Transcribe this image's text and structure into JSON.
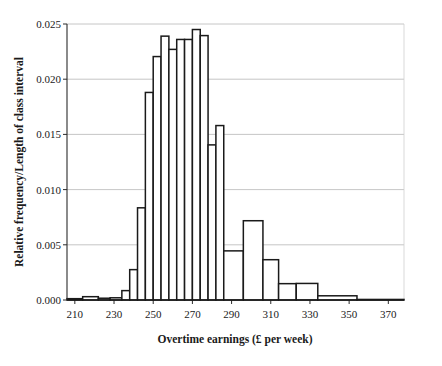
{
  "chart_data": {
    "type": "bar",
    "subtype": "histogram",
    "title": "",
    "xlabel": "Overtime earnings (£ per week)",
    "ylabel": "Relative frequency/Length of class interval",
    "xlim": [
      206,
      378
    ],
    "ylim": [
      0.0,
      0.025
    ],
    "grid": true,
    "legend": false,
    "y_ticks": [
      0.0,
      0.005,
      0.01,
      0.015,
      0.02,
      0.025
    ],
    "y_tick_labels": [
      "0.000",
      "0.005",
      "0.010",
      "0.015",
      "0.020",
      "0.025"
    ],
    "x_ticks": [
      210,
      230,
      250,
      270,
      290,
      310,
      330,
      350,
      370
    ],
    "x_tick_labels": [
      "210",
      "230",
      "250",
      "270",
      "290",
      "310",
      "330",
      "350",
      "370"
    ],
    "bins": [
      {
        "start": 206,
        "end": 214,
        "density": 0.00012
      },
      {
        "start": 214,
        "end": 222,
        "density": 0.0003
      },
      {
        "start": 222,
        "end": 228,
        "density": 0.00016
      },
      {
        "start": 228,
        "end": 234,
        "density": 0.0002
      },
      {
        "start": 234,
        "end": 238,
        "density": 0.00085
      },
      {
        "start": 238,
        "end": 242,
        "density": 0.00275
      },
      {
        "start": 242,
        "end": 246,
        "density": 0.00835
      },
      {
        "start": 246,
        "end": 250,
        "density": 0.0188
      },
      {
        "start": 250,
        "end": 254,
        "density": 0.02205
      },
      {
        "start": 254,
        "end": 258,
        "density": 0.0239
      },
      {
        "start": 258,
        "end": 262,
        "density": 0.0227
      },
      {
        "start": 262,
        "end": 266,
        "density": 0.0236
      },
      {
        "start": 266,
        "end": 270,
        "density": 0.0236
      },
      {
        "start": 270,
        "end": 274,
        "density": 0.0245
      },
      {
        "start": 274,
        "end": 278,
        "density": 0.02395
      },
      {
        "start": 278,
        "end": 282,
        "density": 0.01405
      },
      {
        "start": 282,
        "end": 286,
        "density": 0.0158
      },
      {
        "start": 286,
        "end": 296,
        "density": 0.00445
      },
      {
        "start": 296,
        "end": 306,
        "density": 0.00718
      },
      {
        "start": 306,
        "end": 314,
        "density": 0.00365
      },
      {
        "start": 314,
        "end": 323,
        "density": 0.00148
      },
      {
        "start": 323,
        "end": 334,
        "density": 0.0015
      },
      {
        "start": 334,
        "end": 354,
        "density": 0.00038
      },
      {
        "start": 354,
        "end": 378,
        "density": 5e-05
      }
    ]
  },
  "colors": {
    "bar_fill": "#ffffff",
    "bar_stroke": "#1a1a1a",
    "grid": "#b8b8b8",
    "axis": "#2b2b2b",
    "text": "#1a1a1a",
    "background": "#ffffff"
  }
}
